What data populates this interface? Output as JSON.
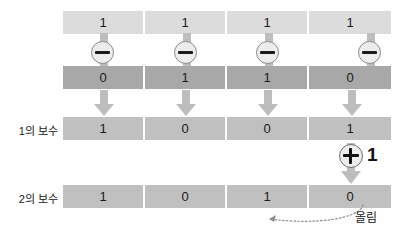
{
  "diagram": {
    "columns": 4,
    "rows": [
      {
        "id": "input",
        "label": "",
        "style": "light",
        "bits": [
          "1",
          "1",
          "1",
          "1"
        ]
      },
      {
        "id": "inverted",
        "label": "",
        "style": "dark",
        "bits": [
          "0",
          "1",
          "1",
          "0"
        ]
      },
      {
        "id": "ones-complement",
        "label": "1의 보수",
        "style": "mid",
        "bits": [
          "1",
          "0",
          "0",
          "1"
        ]
      },
      {
        "id": "twos-complement",
        "label": "2의 보수",
        "style": "mid",
        "bits": [
          "1",
          "0",
          "1",
          "0"
        ]
      }
    ],
    "operators": {
      "not_symbol": "minus-in-circle",
      "not_count": 4,
      "plus_symbol": "plus-in-circle",
      "plus_one_text": "1",
      "carry_label": "올림"
    },
    "colors": {
      "row_light": "#dcdcdc",
      "row_dark": "#a8a8a8",
      "row_mid": "#c0c0c0",
      "arrow": "#bdbdbd",
      "text": "#1a1a1a",
      "background": "#ffffff"
    }
  }
}
